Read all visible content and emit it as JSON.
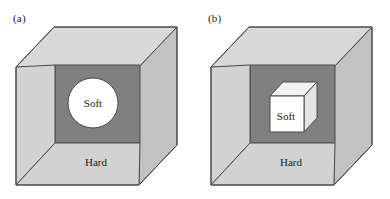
{
  "figure": {
    "background_color": "#ffffff",
    "width": 390,
    "height": 199
  },
  "colors": {
    "outer_face_light": "#d2d2d2",
    "outer_face_top": "#d8d8d8",
    "outer_face_side": "#c2c2c2",
    "cavity_dark": "#808080",
    "inclusion_white": "#ffffff",
    "inclusion_shade_top": "#f2f2f2",
    "inclusion_shade_side": "#e4e4e4",
    "outline": "#4a4a4a",
    "text": "#1a1a1a"
  },
  "panels": [
    {
      "id": "a",
      "label": "(a)",
      "matrix_label": "Hard",
      "inclusion_label": "Soft",
      "inclusion_shape": "sphere",
      "geometry": {
        "front_face": {
          "left": 16,
          "top": 67,
          "right": 139,
          "bottom": 185
        },
        "depth_dx": 38,
        "depth_dy": -40,
        "cavity": {
          "left": 55,
          "top": 65,
          "right": 140,
          "bottom": 143
        },
        "sphere": {
          "cx": 93,
          "cy": 103,
          "r": 25
        },
        "matrix_label_pos": {
          "x": 96,
          "y": 163
        },
        "inclusion_label_pos": {
          "x": 93,
          "y": 104
        }
      }
    },
    {
      "id": "b",
      "label": "(b)",
      "matrix_label": "Hard",
      "inclusion_label": "Soft",
      "inclusion_shape": "cube",
      "geometry": {
        "front_face": {
          "left": 16,
          "top": 67,
          "right": 139,
          "bottom": 185
        },
        "depth_dx": 38,
        "depth_dy": -40,
        "cavity": {
          "left": 55,
          "top": 65,
          "right": 140,
          "bottom": 143
        },
        "inner_cube": {
          "left": 75,
          "top": 96,
          "right": 109,
          "bottom": 132,
          "dx": 13,
          "dy": -14
        },
        "matrix_label_pos": {
          "x": 96,
          "y": 163
        },
        "inclusion_label_pos": {
          "x": 91,
          "y": 117
        }
      }
    }
  ]
}
